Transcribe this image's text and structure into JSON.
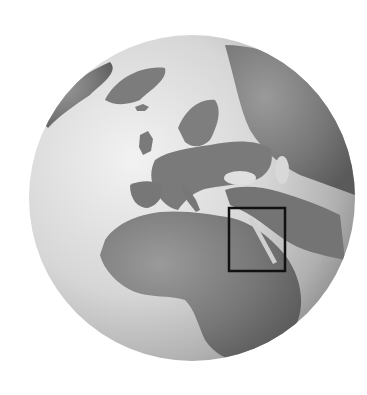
{
  "figure": {
    "type": "orthographic-globe",
    "style": "grayscale relief",
    "center_region": "Europe / North Africa",
    "visible_regions": [
      "Greenland",
      "Iceland",
      "Scandinavia",
      "British Isles",
      "Iberian Peninsula",
      "Italy",
      "Mediterranean Sea",
      "Black Sea",
      "Caspian Sea",
      "North Africa",
      "Sahara",
      "Arabian Peninsula",
      "Red Sea",
      "West Africa",
      "Central Africa"
    ],
    "highlight": {
      "shape": "rectangle",
      "region": "Egypt / Red Sea",
      "x": 229,
      "y": 208,
      "width": 56,
      "height": 63,
      "stroke_color": "#111111"
    }
  },
  "colors": {
    "background": "#ffffff",
    "ocean_light": "#e6e6e6",
    "ocean_dark": "#9a9a9a",
    "land": "#7a7a7a",
    "land_dark": "#5e5e5e"
  }
}
